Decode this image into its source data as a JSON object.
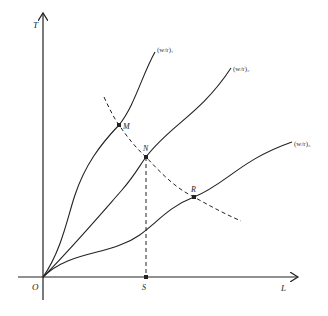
{
  "diagram": {
    "axes": {
      "y_label": "T",
      "x_label": "L",
      "origin_label": "O"
    },
    "curves": [
      {
        "id": "curve-1",
        "label": "(w/r)₁"
      },
      {
        "id": "curve-2",
        "label": "(w/r)₂"
      },
      {
        "id": "curve-3",
        "label": "(w/r)₃"
      }
    ],
    "points": {
      "M": "M",
      "N": "N",
      "R": "R",
      "S": "S"
    },
    "colors": {
      "line": "#222222",
      "background": "#ffffff"
    }
  }
}
